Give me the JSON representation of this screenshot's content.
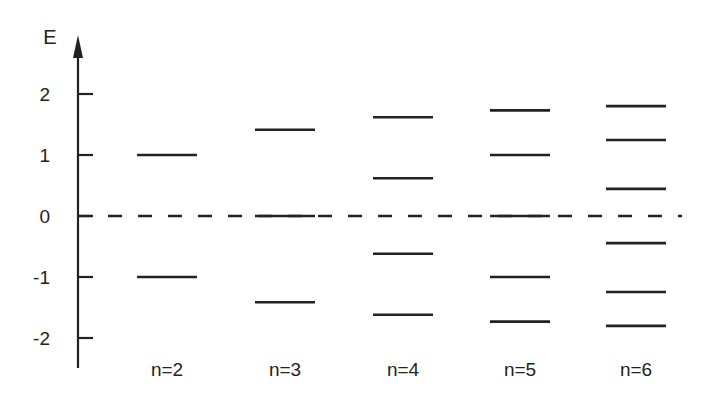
{
  "chart_data": {
    "type": "energy-level-diagram",
    "title": "",
    "ylabel": "E",
    "xlabel": "",
    "yticks": [
      2,
      1,
      0,
      -1,
      -2
    ],
    "ytick_labels": [
      "2",
      "1",
      "0",
      "-1",
      "-2"
    ],
    "ylim": [
      -2.3,
      2.9
    ],
    "reference_line": {
      "value": 0,
      "style": "dashed"
    },
    "categories": [
      "n=2",
      "n=3",
      "n=4",
      "n=5",
      "n=6"
    ],
    "series": [
      {
        "name": "n=2",
        "levels": [
          1.0,
          -1.0
        ]
      },
      {
        "name": "n=3",
        "levels": [
          1.414,
          0.0,
          -1.414
        ]
      },
      {
        "name": "n=4",
        "levels": [
          1.618,
          0.618,
          -0.618,
          -1.618
        ]
      },
      {
        "name": "n=5",
        "levels": [
          1.732,
          1.0,
          0.0,
          -1.0,
          -1.732
        ]
      },
      {
        "name": "n=6",
        "levels": [
          1.802,
          1.247,
          0.445,
          -0.445,
          -1.247,
          -1.802
        ]
      }
    ],
    "colors": {
      "line": "#222222",
      "background": "#ffffff"
    }
  }
}
